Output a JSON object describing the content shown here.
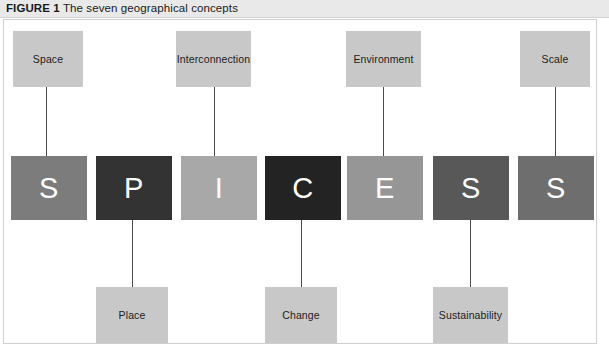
{
  "caption": {
    "figure_label": "FIGURE 1",
    "title": "The seven geographical concepts"
  },
  "diagram": {
    "acronym": "SPICESS",
    "label_box_color": "#c8c8c8",
    "connector_color": "#4b4b4b",
    "frame_border_color": "#cfcfcf",
    "letters": [
      {
        "letter": "S",
        "concept": "Space",
        "position": "top",
        "color": "#7c7c7c"
      },
      {
        "letter": "P",
        "concept": "Place",
        "position": "bottom",
        "color": "#333333"
      },
      {
        "letter": "I",
        "concept": "Interconnection",
        "position": "top",
        "color": "#a8a8a8"
      },
      {
        "letter": "C",
        "concept": "Change",
        "position": "bottom",
        "color": "#232323"
      },
      {
        "letter": "E",
        "concept": "Environment",
        "position": "top",
        "color": "#969696"
      },
      {
        "letter": "S",
        "concept": "Sustainability",
        "position": "bottom",
        "color": "#585858"
      },
      {
        "letter": "S",
        "concept": "Scale",
        "position": "top",
        "color": "#6e6e6e"
      }
    ]
  }
}
